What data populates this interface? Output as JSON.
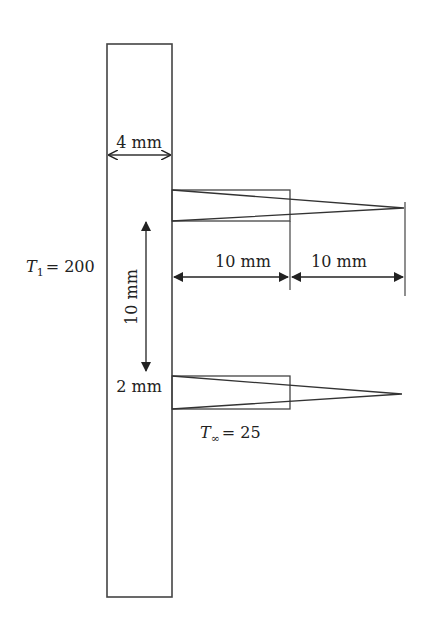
{
  "diagram": {
    "wall": {
      "width_label": "4 mm",
      "temperature_label_symbol": "T",
      "temperature_label_sub": "1",
      "temperature_label_value": "= 200"
    },
    "fin_spacing_label": "10 mm",
    "fin_thickness_label": "2 mm",
    "rect_fin_length_label": "10 mm",
    "tri_fin_extra_length_label": "10 mm",
    "ambient_label_symbol": "T",
    "ambient_label_sub": "∞",
    "ambient_label_value": "= 25",
    "colors": {
      "line": "#333333",
      "background": "#ffffff"
    }
  }
}
